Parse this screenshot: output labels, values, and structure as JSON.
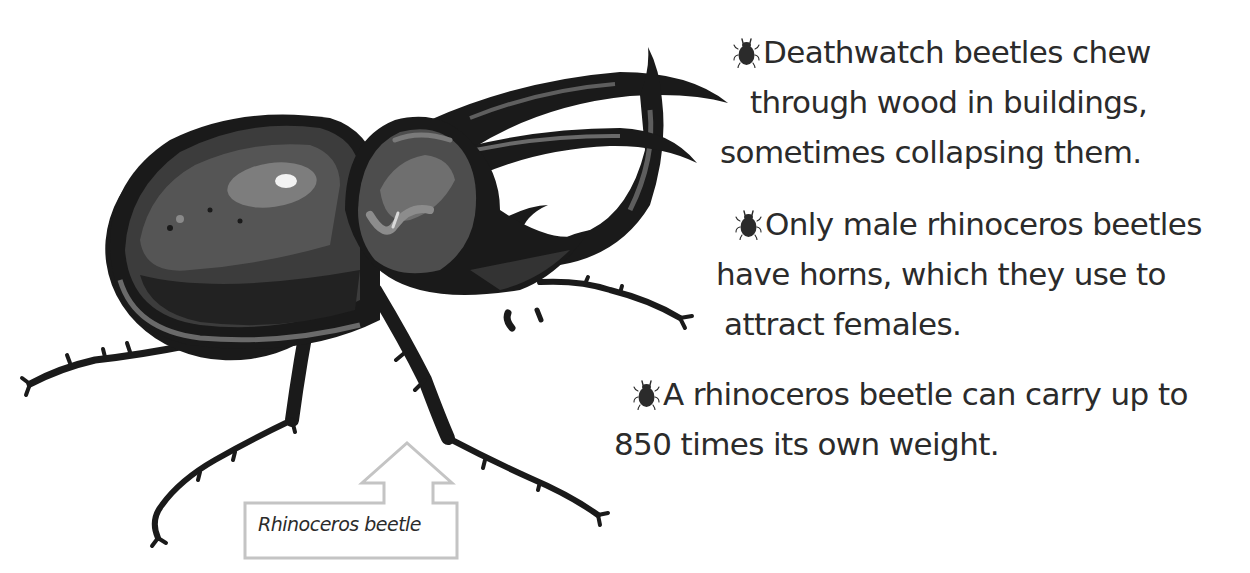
{
  "illustration": {
    "subject": "rhinoceros-beetle",
    "label": "Rhinoceros beetle",
    "colors": {
      "outline": "#1a1a1a",
      "body_dark": "#222222",
      "body_mid": "#4a4a4a",
      "body_light": "#7a7a7a",
      "highlight": "#bdbdbd",
      "callout_border": "#c4c4c4"
    }
  },
  "facts": [
    {
      "icon": "beetle-bullet-icon",
      "lines": [
        "Deathwatch beetles chew",
        "through wood in buildings,",
        "sometimes collapsing them."
      ]
    },
    {
      "icon": "beetle-bullet-icon",
      "lines": [
        "Only male rhinoceros beetles",
        "have horns, which they use to",
        "attract females."
      ]
    },
    {
      "icon": "beetle-bullet-icon",
      "lines": [
        "A rhinoceros beetle can carry up to",
        "850 times its own weight."
      ]
    }
  ],
  "colors": {
    "text": "#2b2b2b",
    "background": "#ffffff"
  }
}
